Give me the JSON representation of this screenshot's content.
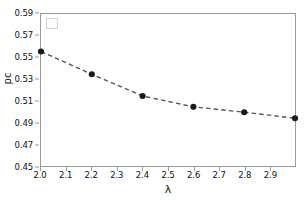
{
  "chart_data": {
    "type": "line",
    "title": "",
    "xlabel": "λ",
    "ylabel": "pc",
    "xlim": [
      2.0,
      3.0
    ],
    "ylim": [
      0.45,
      0.59
    ],
    "xticks": [
      "2.0",
      "2.1",
      "2.2",
      "2.3",
      "2.4",
      "2.5",
      "2.6",
      "2.7",
      "2.8",
      "2.9"
    ],
    "xtick_values": [
      2.0,
      2.1,
      2.2,
      2.3,
      2.4,
      2.5,
      2.6,
      2.7,
      2.8,
      2.9
    ],
    "yticks": [
      "0.59",
      "0.57",
      "0.55",
      "0.53",
      "0.51",
      "0.49",
      "0.47",
      "0.45"
    ],
    "ytick_values": [
      0.59,
      0.57,
      0.55,
      0.53,
      0.51,
      0.49,
      0.47,
      0.45
    ],
    "grid": false,
    "legend_position": "upper left",
    "legend_entries": [],
    "series": [
      {
        "name": "pc",
        "x": [
          2.0,
          2.2,
          2.4,
          2.6,
          2.8,
          3.0
        ],
        "values": [
          0.5555,
          0.5345,
          0.5145,
          0.5045,
          0.4995,
          0.494
        ],
        "line_style": "dashed",
        "line_color": "#555555",
        "marker": "circle",
        "marker_color": "#1a1a1a"
      }
    ]
  },
  "axes": {
    "spine_color": "#9a9a9a",
    "background": "#ffffff"
  }
}
